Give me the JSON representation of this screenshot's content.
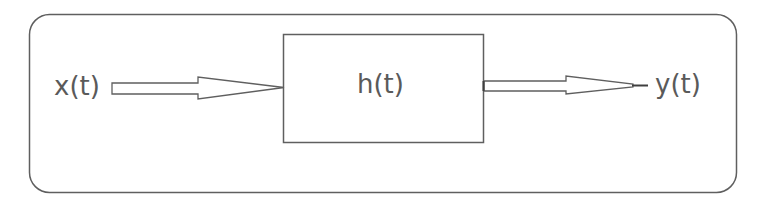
{
  "diagram": {
    "type": "block-diagram",
    "input_label": "x(t)",
    "system_label": "h(t)",
    "output_label": "y(t)",
    "colors": {
      "stroke": "#5f5f5f",
      "text": "#5a5a5a",
      "background": "#ffffff"
    },
    "nodes": [
      {
        "id": "input",
        "label": "x(t)",
        "kind": "signal"
      },
      {
        "id": "system",
        "label": "h(t)",
        "kind": "block"
      },
      {
        "id": "output",
        "label": "y(t)",
        "kind": "signal"
      }
    ],
    "edges": [
      {
        "from": "input",
        "to": "system",
        "style": "hollow-arrow"
      },
      {
        "from": "system",
        "to": "output",
        "style": "hollow-arrow"
      }
    ]
  }
}
